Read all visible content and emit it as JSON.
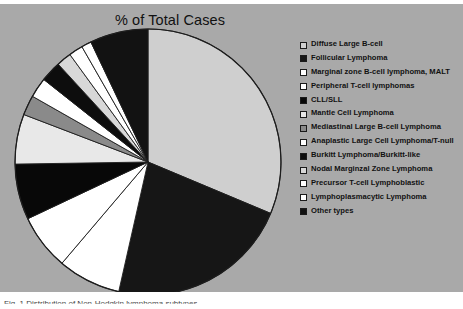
{
  "figure": {
    "title": "% of Total Cases",
    "background_color": "#a9a9a9",
    "caption": "Fig. 1 Distribution of Non-Hodgkin lymphoma subtypes"
  },
  "legend": {
    "position": "right",
    "items": [
      {
        "label": "Diffuse Large B-cell",
        "color": "#cfcfcf"
      },
      {
        "label": "Follicular Lymphoma",
        "color": "#161616"
      },
      {
        "label": "Marginal zone B-cell lymphoma, MALT",
        "color": "#ffffff"
      },
      {
        "label": "Peripheral T-cell lymphomas",
        "color": "#ffffff"
      },
      {
        "label": "CLL/SLL",
        "color": "#080808"
      },
      {
        "label": "Mantle Cell Lymphoma",
        "color": "#e8e8e8"
      },
      {
        "label": "Mediastinal Large B-cell Lymphoma",
        "color": "#8a8a8a"
      },
      {
        "label": "Anaplastic Large Cell Lymphoma/T-null",
        "color": "#ffffff"
      },
      {
        "label": "Burkitt  Lymphoma/Burkitt-like",
        "color": "#0d0d0d"
      },
      {
        "label": "Nodal Marginzal Zone Lymphoma",
        "color": "#d8d8d8"
      },
      {
        "label": "Precursor T-cell Lymphoblastic",
        "color": "#ffffff"
      },
      {
        "label": "Lymphoplasmacytic Lymphoma",
        "color": "#ffffff"
      },
      {
        "label": "Other types",
        "color": "#121212"
      }
    ]
  },
  "chart_data": {
    "type": "pie",
    "title": "% of Total Cases",
    "xlabel": "",
    "ylabel": "",
    "units": "percent of total cases",
    "start_angle_deg": 0,
    "direction": "clockwise",
    "legend_position": "right",
    "grid": false,
    "categories": [
      "Diffuse Large B-cell",
      "Follicular Lymphoma",
      "Marginal zone B-cell lymphoma, MALT",
      "Peripheral T-cell lymphomas",
      "CLL/SLL",
      "Mantle Cell Lymphoma",
      "Mediastinal Large B-cell Lymphoma",
      "Anaplastic Large Cell Lymphoma/T-null",
      "Burkitt  Lymphoma/Burkitt-like",
      "Nodal Marginzal Zone Lymphoma",
      "Precursor T-cell Lymphoblastic",
      "Lymphoplasmacytic Lymphoma",
      "Other types"
    ],
    "values": [
      31,
      22,
      7.6,
      6.7,
      6.7,
      6,
      2.4,
      2.4,
      2.5,
      1.8,
      1.7,
      1.2,
      7
    ],
    "colors": [
      "#cfcfcf",
      "#161616",
      "#ffffff",
      "#ffffff",
      "#080808",
      "#e8e8e8",
      "#8a8a8a",
      "#ffffff",
      "#0d0d0d",
      "#d8d8d8",
      "#ffffff",
      "#ffffff",
      "#121212"
    ]
  }
}
